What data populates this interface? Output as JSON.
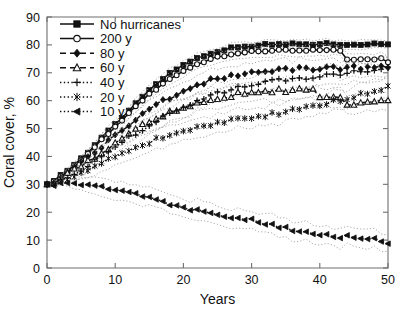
{
  "chart_data": {
    "type": "line",
    "title": "",
    "xlabel": "Years",
    "ylabel": "Coral cover, %",
    "xlim": [
      0,
      50
    ],
    "ylim": [
      0,
      90
    ],
    "xticks": [
      0,
      10,
      20,
      30,
      40,
      50
    ],
    "yticks": [
      0,
      10,
      20,
      30,
      40,
      50,
      60,
      70,
      80,
      90
    ],
    "grid": false,
    "legend_position": "upper-left",
    "confidence_bands": "dotted grey bands around each mean curve",
    "x": [
      0,
      1,
      2,
      3,
      4,
      5,
      6,
      7,
      8,
      9,
      10,
      11,
      12,
      13,
      14,
      15,
      16,
      17,
      18,
      19,
      20,
      21,
      22,
      23,
      24,
      25,
      26,
      27,
      28,
      29,
      30,
      31,
      32,
      33,
      34,
      35,
      36,
      37,
      38,
      39,
      40,
      41,
      42,
      43,
      44,
      45,
      46,
      47,
      48,
      49,
      50
    ],
    "series": [
      {
        "name": "No hurricanes",
        "label": "No hurricanes",
        "marker": "square",
        "marker_filled": true,
        "linestyle": "solid",
        "values": [
          30,
          31.5,
          33.2,
          35,
          37,
          39.2,
          41.5,
          44,
          46.5,
          49,
          51.5,
          54,
          56.5,
          59,
          61.5,
          64,
          66,
          68,
          69.8,
          71.4,
          72.8,
          74,
          75.2,
          76.2,
          77,
          77.7,
          78.3,
          78.8,
          79.2,
          79.5,
          79.7,
          79.9,
          80,
          80.1,
          80.2,
          80.2,
          80.3,
          80.3,
          80.3,
          80.3,
          80.3,
          80.3,
          80.3,
          80.3,
          80.3,
          80.3,
          80.3,
          80.3,
          80.3,
          80.3,
          80.3
        ]
      },
      {
        "name": "200 y",
        "label": "200 y",
        "marker": "circle",
        "marker_filled": false,
        "linestyle": "solid",
        "values": [
          30,
          31.4,
          33,
          34.8,
          36.7,
          38.8,
          41,
          43.4,
          45.8,
          48.2,
          50.6,
          53,
          55.4,
          57.7,
          60,
          62.2,
          64.2,
          66.1,
          67.8,
          69.3,
          70.7,
          71.9,
          73,
          74,
          74.9,
          75.6,
          76.2,
          76.7,
          77.1,
          77.4,
          77.6,
          77.8,
          77.9,
          78,
          78.1,
          78.2,
          78.2,
          78.2,
          78.2,
          78.2,
          78.2,
          78.2,
          78.2,
          78.2,
          74.5,
          74.6,
          74.8,
          74.9,
          75,
          75.1,
          73.5
        ]
      },
      {
        "name": "80 y",
        "label": "80 y",
        "marker": "diamond",
        "marker_filled": true,
        "linestyle": "dashed",
        "values": [
          30,
          31.2,
          32.6,
          34.2,
          35.9,
          37.7,
          39.6,
          41.6,
          43.6,
          45.6,
          47.6,
          49.5,
          51.4,
          53.2,
          55,
          56.6,
          58.2,
          59.7,
          61,
          62.3,
          63.5,
          64.6,
          65.5,
          66.4,
          67.2,
          67.9,
          68.5,
          69,
          69.4,
          69.8,
          70.1,
          70.4,
          70.6,
          70.8,
          71,
          71.1,
          71.2,
          71.3,
          71.4,
          71.5,
          71.5,
          71.6,
          71.6,
          71.7,
          71.7,
          71.8,
          71.8,
          71.9,
          71.9,
          72,
          72
        ]
      },
      {
        "name": "60 y",
        "label": "60 y",
        "marker": "triangle",
        "marker_filled": false,
        "linestyle": "dashed",
        "values": [
          30,
          31,
          32.2,
          33.5,
          34.9,
          36.4,
          38,
          39.7,
          41.4,
          43.1,
          44.8,
          46.4,
          48,
          49.5,
          50.9,
          52.2,
          53.4,
          54.5,
          55.6,
          56.6,
          57.5,
          58.3,
          59.1,
          59.8,
          60.4,
          61,
          61.5,
          61.9,
          62.3,
          62.6,
          62.9,
          63.1,
          63.3,
          63.5,
          63.6,
          63.7,
          63.8,
          63.9,
          64,
          64,
          61.5,
          61.6,
          61.7,
          61.8,
          58.5,
          58.7,
          58.9,
          59,
          59.2,
          59.4,
          59.5
        ]
      },
      {
        "name": "40 y",
        "label": "40 y",
        "marker": "plus",
        "marker_filled": true,
        "linestyle": "dotted",
        "values": [
          30,
          30.9,
          31.9,
          33,
          34.2,
          35.5,
          36.9,
          38.4,
          40,
          41.6,
          43.3,
          45,
          46.6,
          48.2,
          49.8,
          51.3,
          52.7,
          54.1,
          55.4,
          56.6,
          57.8,
          58.9,
          59.9,
          60.9,
          61.8,
          62.6,
          63.3,
          64,
          64.6,
          65.1,
          65.6,
          66,
          66.4,
          66.8,
          67.1,
          67.4,
          67.7,
          68,
          68.3,
          68.6,
          68.9,
          69.2,
          69.5,
          69.8,
          70.1,
          70.4,
          70.7,
          71,
          71.4,
          71.8,
          72.2
        ]
      },
      {
        "name": "20 y",
        "label": "20 y",
        "marker": "star",
        "marker_filled": true,
        "linestyle": "dotted",
        "values": [
          30,
          30.6,
          31.3,
          32.1,
          33,
          34,
          35.1,
          36.2,
          37.4,
          38.6,
          39.8,
          41,
          42.1,
          43.2,
          44.2,
          45.2,
          46.1,
          47,
          47.8,
          48.6,
          49.3,
          50,
          50.6,
          51.2,
          51.7,
          52.2,
          52.6,
          53,
          53.4,
          53.8,
          54.1,
          54.5,
          54.8,
          55.2,
          55.6,
          56,
          56.5,
          57,
          57.5,
          58,
          58.6,
          59.2,
          59.8,
          60.4,
          61,
          61.6,
          62.2,
          62.8,
          63.4,
          64,
          64.6
        ]
      },
      {
        "name": "10 y",
        "label": "10 y",
        "marker": "left-triangle",
        "marker_filled": true,
        "linestyle": "dotted",
        "values": [
          30,
          30.2,
          30.4,
          30.6,
          30.5,
          30.2,
          29.8,
          29.4,
          29,
          28.5,
          28,
          27.4,
          26.8,
          26.2,
          25.6,
          25,
          24.4,
          23.8,
          23.2,
          22.6,
          22,
          21.4,
          20.9,
          20.4,
          19.9,
          19.4,
          18.9,
          18.4,
          17.9,
          17.4,
          16.9,
          16.4,
          15.9,
          15.4,
          14.9,
          14.4,
          13.9,
          13.5,
          13.1,
          12.7,
          12.3,
          12,
          11.7,
          11.4,
          11.1,
          10.9,
          10.7,
          10.5,
          10.3,
          9.5,
          8.8
        ]
      }
    ]
  },
  "legend": {
    "entries": [
      {
        "label": "No hurricanes"
      },
      {
        "label": "200 y"
      },
      {
        "label": "80 y"
      },
      {
        "label": "60 y"
      },
      {
        "label": "40 y"
      },
      {
        "label": "20 y"
      },
      {
        "label": "10 y"
      }
    ]
  },
  "axis": {
    "x_label": "Years",
    "y_label": "Coral cover, %",
    "x_tick_labels": [
      "0",
      "10",
      "20",
      "30",
      "40",
      "50"
    ],
    "y_tick_labels": [
      "0",
      "10",
      "20",
      "30",
      "40",
      "50",
      "60",
      "70",
      "80",
      "90"
    ]
  },
  "colors": {
    "line": "#111111",
    "band": "#9a9a9a",
    "axis": "#6f6f6f",
    "background": "#ffffff"
  }
}
